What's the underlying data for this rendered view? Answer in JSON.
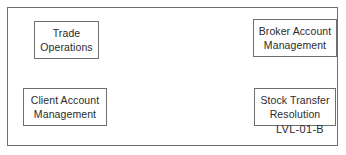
{
  "diagram": {
    "id_label": "LVL-01-B",
    "frame": {
      "border_color": "#6e6e6e",
      "background": "#ffffff"
    },
    "text_color": "#2b2b2b",
    "boxes": [
      {
        "name": "trade-operations",
        "line1": "Trade",
        "line2": "Operations"
      },
      {
        "name": "broker-account-management",
        "line1": "Broker Account",
        "line2": "Management"
      },
      {
        "name": "client-account-management",
        "line1": "Client Account",
        "line2": "Management"
      },
      {
        "name": "stock-transfer-resolution",
        "line1": "Stock Transfer",
        "line2": "Resolution"
      }
    ]
  }
}
